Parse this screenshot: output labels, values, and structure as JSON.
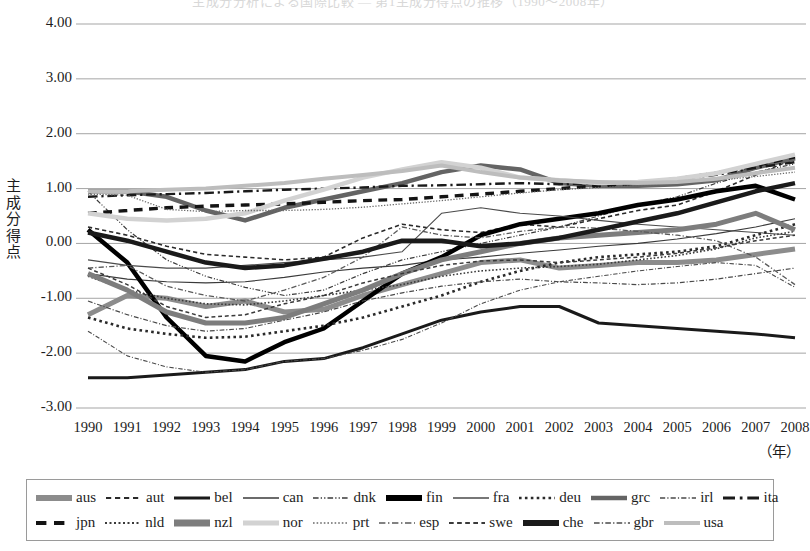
{
  "title": "主成分分析による国際比較 ― 第1主成分得点の推移（1990～2008年）",
  "axes": {
    "y_label_chars": [
      "主",
      "成",
      "分",
      "得",
      "点"
    ],
    "y_ticks": [
      "4.00",
      "3.00",
      "2.00",
      "1.00",
      "0.00",
      "-1.00",
      "-2.00",
      "-3.00"
    ],
    "x_unit": "（年）"
  },
  "chart_data": {
    "type": "line",
    "title": "主成分分析による国際比較 ― 第1主成分得点の推移（1990～2008年）",
    "xlabel": "（年）",
    "ylabel": "主成分得点",
    "ylim": [
      -3.0,
      4.0
    ],
    "ytick_values": [
      4.0,
      3.0,
      2.0,
      1.0,
      0.0,
      -1.0,
      -2.0,
      -3.0
    ],
    "grid": true,
    "legend_position": "bottom",
    "x": [
      1990,
      1991,
      1992,
      1993,
      1994,
      1995,
      1996,
      1997,
      1998,
      1999,
      2000,
      2001,
      2002,
      2003,
      2004,
      2005,
      2006,
      2007,
      2008
    ],
    "categories": [
      "1990",
      "1991",
      "1992",
      "1993",
      "1994",
      "1995",
      "1996",
      "1997",
      "1998",
      "1999",
      "2000",
      "2001",
      "2002",
      "2003",
      "2004",
      "2005",
      "2006",
      "2007",
      "2008"
    ],
    "series": [
      {
        "name": "aus",
        "style": "solid",
        "width": 5,
        "color": "#8c8c8c",
        "values": [
          -1.3,
          -0.95,
          -1.0,
          -1.15,
          -1.05,
          -1.25,
          -1.2,
          -0.95,
          -0.75,
          -0.55,
          -0.35,
          -0.3,
          -0.45,
          -0.4,
          -0.35,
          -0.35,
          -0.3,
          -0.2,
          -0.1
        ]
      },
      {
        "name": "aut",
        "style": "dashed",
        "width": 1.6,
        "color": "#2a2a2a",
        "values": [
          0.3,
          0.15,
          -0.05,
          -0.2,
          -0.25,
          -0.3,
          -0.25,
          0.1,
          0.35,
          0.25,
          0.2,
          0.35,
          0.3,
          0.45,
          0.6,
          0.7,
          0.95,
          1.25,
          1.55
        ]
      },
      {
        "name": "bel",
        "style": "solid",
        "width": 3,
        "color": "#1a1a1a",
        "values": [
          -2.45,
          -2.45,
          -2.4,
          -2.35,
          -2.3,
          -2.15,
          -2.1,
          -1.9,
          -1.65,
          -1.4,
          -1.25,
          -1.15,
          -1.15,
          -1.45,
          -1.5,
          -1.55,
          -1.6,
          -1.65,
          -1.72
        ]
      },
      {
        "name": "can",
        "style": "solid",
        "width": 1.1,
        "color": "#3a3a3a",
        "values": [
          -0.55,
          -0.65,
          -0.7,
          -0.72,
          -0.7,
          -0.62,
          -0.52,
          -0.45,
          -0.4,
          -0.3,
          -0.25,
          -0.18,
          -0.12,
          -0.05,
          0.0,
          0.08,
          0.18,
          0.3,
          0.45
        ]
      },
      {
        "name": "dnk",
        "style": "dashdotdot",
        "width": 1.2,
        "color": "#3a3a3a",
        "values": [
          0.95,
          0.25,
          -0.3,
          -0.6,
          -0.8,
          -0.95,
          -0.85,
          -0.55,
          -0.3,
          -0.15,
          0.0,
          0.15,
          0.3,
          0.5,
          0.7,
          0.85,
          1.1,
          1.3,
          1.45
        ]
      },
      {
        "name": "fin",
        "style": "solid",
        "width": 4.5,
        "color": "#000000",
        "values": [
          0.25,
          -0.35,
          -1.35,
          -2.05,
          -2.15,
          -1.8,
          -1.55,
          -1.05,
          -0.55,
          -0.25,
          0.15,
          0.35,
          0.45,
          0.55,
          0.7,
          0.8,
          0.95,
          1.05,
          0.8
        ]
      },
      {
        "name": "fra",
        "style": "solid",
        "width": 1.1,
        "color": "#4a4a4a",
        "values": [
          -0.3,
          -0.4,
          -0.45,
          -0.45,
          -0.4,
          -0.35,
          -0.3,
          -0.25,
          -0.15,
          0.55,
          0.65,
          0.55,
          0.5,
          0.42,
          0.35,
          0.3,
          0.25,
          0.2,
          0.15
        ]
      },
      {
        "name": "deu",
        "style": "dotted",
        "width": 2.6,
        "color": "#2a2a2a",
        "values": [
          -1.35,
          -1.55,
          -1.65,
          -1.72,
          -1.7,
          -1.6,
          -1.5,
          -1.35,
          -1.15,
          -0.95,
          -0.7,
          -0.5,
          -0.35,
          -0.25,
          -0.2,
          -0.15,
          -0.05,
          0.15,
          0.35
        ]
      },
      {
        "name": "grc",
        "style": "solid",
        "width": 4.5,
        "color": "#646464",
        "values": [
          0.95,
          0.95,
          0.85,
          0.6,
          0.42,
          0.65,
          0.8,
          0.95,
          1.1,
          1.3,
          1.42,
          1.35,
          1.1,
          1.05,
          1.05,
          1.08,
          1.15,
          1.38,
          1.55
        ]
      },
      {
        "name": "irl",
        "style": "dashdot",
        "width": 1.1,
        "color": "#4a4a4a",
        "values": [
          -1.6,
          -2.05,
          -2.25,
          -2.35,
          -2.3,
          -2.15,
          -2.1,
          -1.95,
          -1.75,
          -1.45,
          -1.1,
          -0.85,
          -0.7,
          -0.6,
          -0.5,
          -0.42,
          -0.35,
          -0.4,
          -0.8
        ]
      },
      {
        "name": "ita",
        "style": "dashdot",
        "width": 2.4,
        "color": "#1a1a1a",
        "values": [
          0.85,
          0.88,
          0.9,
          0.92,
          0.95,
          0.98,
          1.0,
          1.02,
          1.05,
          1.06,
          1.08,
          1.1,
          1.08,
          1.1,
          1.12,
          1.18,
          1.25,
          1.38,
          1.48
        ]
      },
      {
        "name": "jpn",
        "style": "dashed",
        "width": 3.4,
        "color": "#141414",
        "values": [
          0.55,
          0.6,
          0.65,
          0.68,
          0.7,
          0.72,
          0.75,
          0.78,
          0.8,
          0.85,
          0.9,
          0.95,
          1.0,
          1.05,
          1.1,
          1.18,
          1.28,
          1.42,
          1.58
        ]
      },
      {
        "name": "nld",
        "style": "dotted",
        "width": 1.6,
        "color": "#3a3a3a",
        "values": [
          -0.6,
          -0.85,
          -1.0,
          -1.1,
          -1.12,
          -1.05,
          -0.95,
          -0.85,
          -0.75,
          -0.6,
          -0.5,
          -0.45,
          -0.42,
          -0.38,
          -0.3,
          -0.22,
          -0.1,
          0.1,
          0.22
        ]
      },
      {
        "name": "nzl",
        "style": "solid",
        "width": 5,
        "color": "#7d7d7d",
        "values": [
          -0.55,
          -0.85,
          -1.25,
          -1.45,
          -1.45,
          -1.35,
          -1.1,
          -0.85,
          -0.55,
          -0.3,
          -0.15,
          0.0,
          0.1,
          0.15,
          0.2,
          0.25,
          0.35,
          0.55,
          0.25
        ]
      },
      {
        "name": "nor",
        "style": "solid",
        "width": 4.5,
        "color": "#d2d2d2",
        "values": [
          0.55,
          0.45,
          0.42,
          0.45,
          0.55,
          0.78,
          0.98,
          1.2,
          1.35,
          1.48,
          1.38,
          1.2,
          1.15,
          1.1,
          1.12,
          1.18,
          1.28,
          1.45,
          1.62
        ]
      },
      {
        "name": "prt",
        "style": "dotted",
        "width": 1.3,
        "color": "#6a6a6a",
        "values": [
          0.9,
          0.88,
          0.62,
          0.58,
          0.6,
          0.6,
          0.62,
          0.66,
          0.72,
          0.78,
          0.85,
          0.92,
          0.98,
          1.02,
          1.05,
          1.1,
          1.15,
          1.22,
          1.3
        ]
      },
      {
        "name": "esp",
        "style": "dashdot",
        "width": 1.3,
        "color": "#5a5a5a",
        "values": [
          -0.45,
          -0.4,
          -0.78,
          -0.95,
          -1.05,
          -0.85,
          -0.62,
          -0.25,
          0.3,
          0.15,
          0.1,
          0.22,
          0.3,
          0.28,
          0.22,
          0.15,
          0.05,
          -0.25,
          -0.75
        ]
      },
      {
        "name": "swe",
        "style": "dashed",
        "width": 1.5,
        "color": "#3a3a3a",
        "values": [
          -0.45,
          -0.75,
          -1.15,
          -1.35,
          -1.3,
          -1.1,
          -0.95,
          -0.72,
          -0.55,
          -0.4,
          -0.32,
          -0.3,
          -0.35,
          -0.3,
          -0.25,
          -0.18,
          -0.08,
          0.05,
          0.15
        ]
      },
      {
        "name": "che",
        "style": "solid",
        "width": 4.5,
        "color": "#1a1a1a",
        "values": [
          0.2,
          0.05,
          -0.15,
          -0.35,
          -0.45,
          -0.4,
          -0.28,
          -0.15,
          0.05,
          0.05,
          -0.05,
          0.0,
          0.1,
          0.25,
          0.4,
          0.55,
          0.75,
          0.95,
          1.1
        ]
      },
      {
        "name": "gbr",
        "style": "dashdot",
        "width": 1.2,
        "color": "#4a4a4a",
        "values": [
          -1.05,
          -1.3,
          -1.5,
          -1.6,
          -1.55,
          -1.4,
          -1.25,
          -1.05,
          -0.9,
          -0.78,
          -0.7,
          -0.65,
          -0.7,
          -0.72,
          -0.75,
          -0.72,
          -0.65,
          -0.55,
          -0.45
        ]
      },
      {
        "name": "usa",
        "style": "solid",
        "width": 4,
        "color": "#bdbdbd",
        "values": [
          0.95,
          0.95,
          0.98,
          1.0,
          1.05,
          1.1,
          1.18,
          1.25,
          1.32,
          1.42,
          1.3,
          1.2,
          1.15,
          1.12,
          1.1,
          1.12,
          1.18,
          1.28,
          1.38
        ]
      }
    ]
  },
  "legend": {
    "rows": [
      [
        {
          "label": "aus",
          "style": "solid",
          "width": 6,
          "color": "#8c8c8c"
        },
        {
          "label": "aut",
          "style": "dashed",
          "width": 2,
          "color": "#2a2a2a"
        },
        {
          "label": "bel",
          "style": "solid",
          "width": 3,
          "color": "#1a1a1a"
        },
        {
          "label": "can",
          "style": "solid",
          "width": 1.3,
          "color": "#3a3a3a"
        },
        {
          "label": "dnk",
          "style": "dashdotdot",
          "width": 1.4,
          "color": "#3a3a3a"
        },
        {
          "label": "fin",
          "style": "solid",
          "width": 6,
          "color": "#000000"
        },
        {
          "label": "fra",
          "style": "solid",
          "width": 1.3,
          "color": "#4a4a4a"
        },
        {
          "label": "deu",
          "style": "dotted",
          "width": 2.6,
          "color": "#2a2a2a"
        },
        {
          "label": "grc",
          "style": "solid",
          "width": 4.5,
          "color": "#646464"
        },
        {
          "label": "irl",
          "style": "dashdot",
          "width": 1.3,
          "color": "#4a4a4a"
        },
        {
          "label": "ita",
          "style": "dashdot",
          "width": 3,
          "color": "#1a1a1a"
        }
      ],
      [
        {
          "label": "jpn",
          "style": "dashed",
          "width": 4,
          "color": "#141414"
        },
        {
          "label": "nld",
          "style": "dotted",
          "width": 2,
          "color": "#3a3a3a"
        },
        {
          "label": "nzl",
          "style": "solid",
          "width": 7,
          "color": "#7d7d7d"
        },
        {
          "label": "nor",
          "style": "solid",
          "width": 5,
          "color": "#d2d2d2"
        },
        {
          "label": "prt",
          "style": "dotted",
          "width": 1.6,
          "color": "#6a6a6a"
        },
        {
          "label": "esp",
          "style": "dashdot",
          "width": 1.6,
          "color": "#5a5a5a"
        },
        {
          "label": "swe",
          "style": "dashed",
          "width": 1.8,
          "color": "#3a3a3a"
        },
        {
          "label": "che",
          "style": "solid",
          "width": 6,
          "color": "#1a1a1a"
        },
        {
          "label": "gbr",
          "style": "dashdot",
          "width": 1.4,
          "color": "#4a4a4a"
        },
        {
          "label": "usa",
          "style": "solid",
          "width": 4,
          "color": "#bdbdbd"
        }
      ]
    ]
  }
}
